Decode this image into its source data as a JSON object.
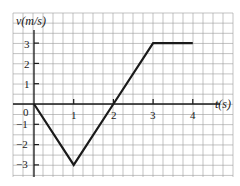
{
  "chart_data": {
    "type": "line",
    "title": "",
    "xlabel": "t(s)",
    "ylabel": "v(m/s)",
    "x": [
      0,
      1,
      2,
      3,
      4
    ],
    "series": [
      {
        "name": "v(t)",
        "values": [
          0,
          -3,
          0,
          3,
          3
        ]
      }
    ],
    "xlim": [
      -0.5,
      5
    ],
    "ylim": [
      -3.5,
      3.5
    ],
    "xticks": [
      "1",
      "2",
      "3",
      "4"
    ],
    "yticks": [
      "3",
      "2",
      "1",
      "0",
      "−1",
      "−2",
      "−3"
    ],
    "grid": true,
    "legend": "none",
    "colors": {
      "line": "#1a1a1a",
      "grid": "#9a9a9a",
      "axis": "#1a1a1a",
      "background": "#ffffff"
    }
  },
  "labels": {
    "y_axis_title": "v(m/s)",
    "x_axis_title": "t(s)",
    "origin": "0",
    "xticks": [
      "1",
      "2",
      "3",
      "4"
    ],
    "yticks_pos": [
      "3",
      "2",
      "1"
    ],
    "yticks_neg": [
      "−1",
      "−2",
      "−3"
    ]
  }
}
